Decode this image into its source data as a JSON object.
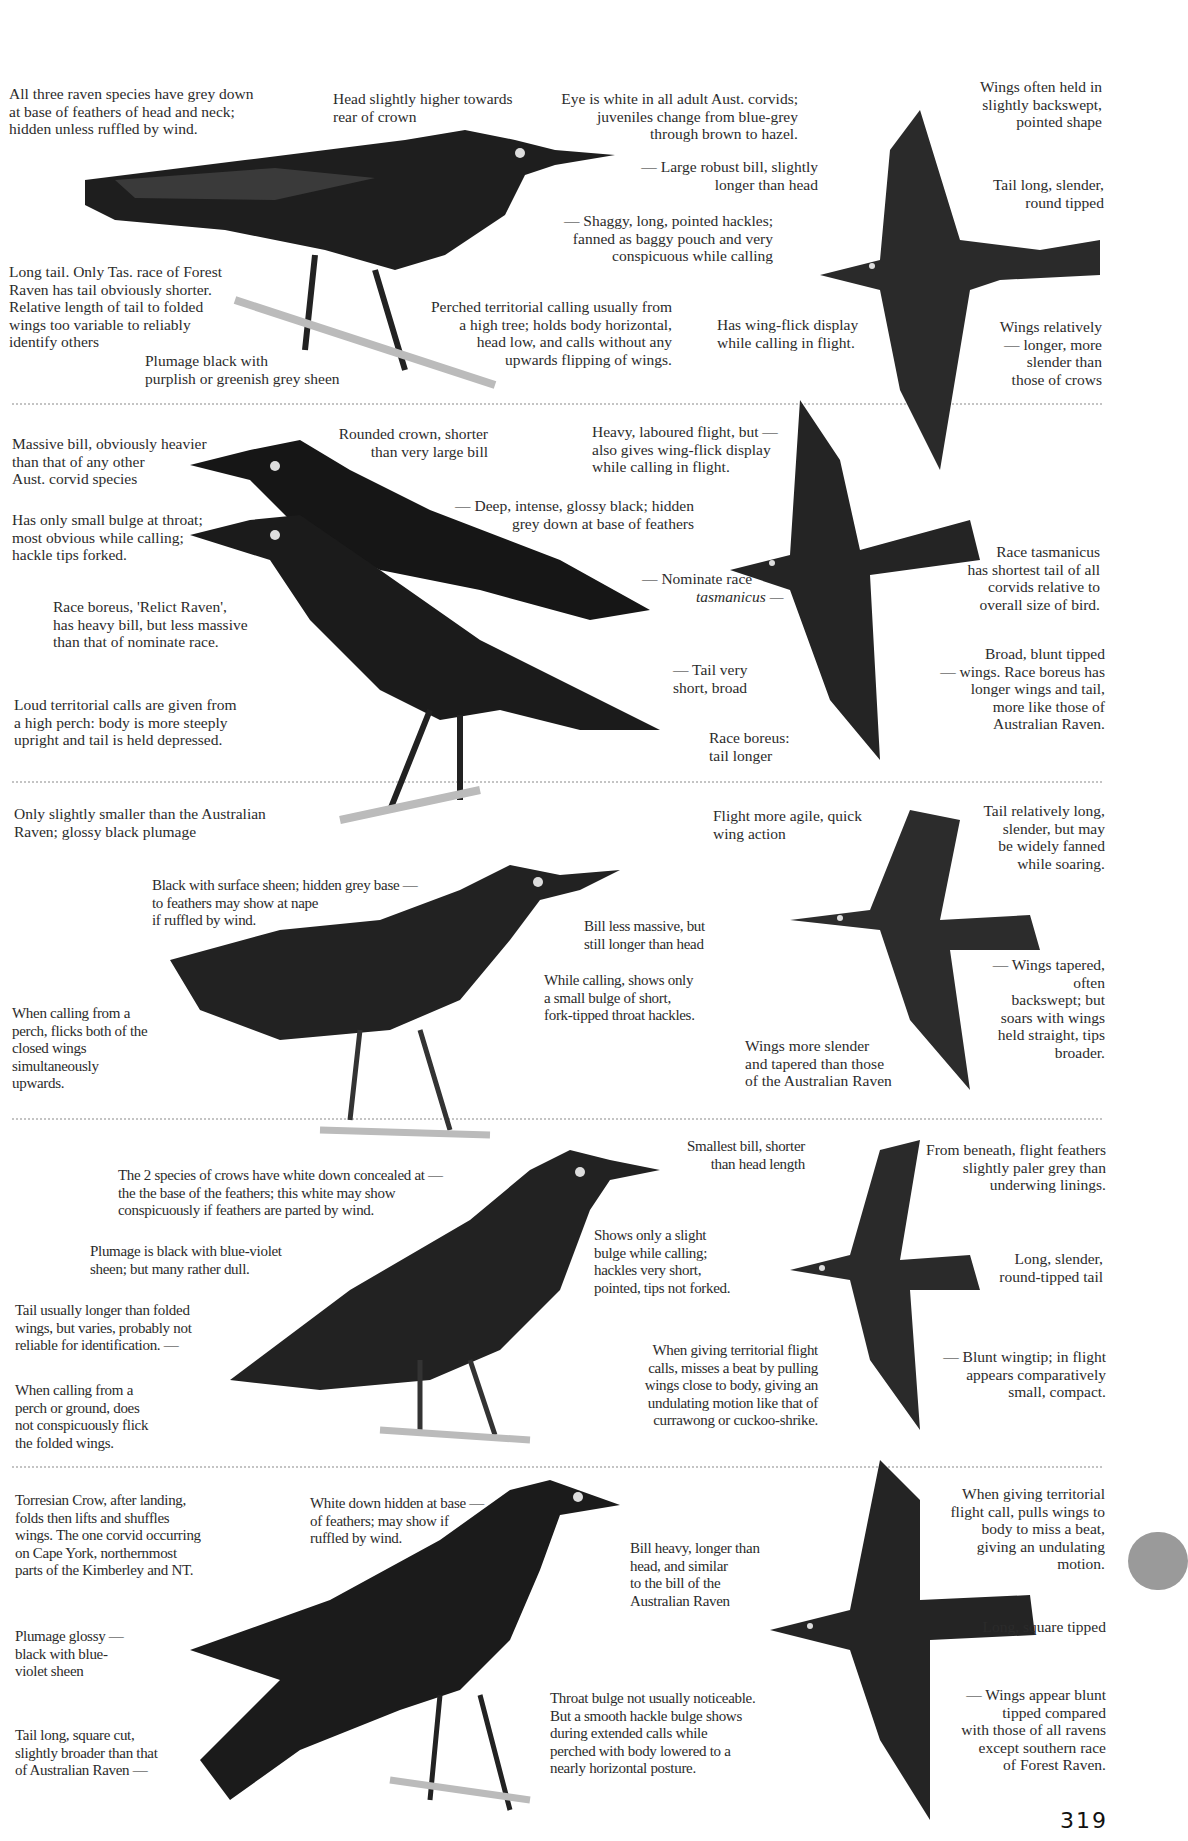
{
  "page": {
    "number": "319",
    "thumb_tab_color": "#9a9a9a",
    "ink_color": "#2b2b2b",
    "bird_color": "#1e1e1e"
  },
  "sections": [
    {
      "id": "raven-1",
      "perched_notes": [
        "All three raven species have grey down\nat base of feathers of head and neck;\nhidden unless ruffled by wind.",
        "Head slightly higher towards\nrear of crown",
        "Eye is white in all adult Aust. corvids;\njuveniles change from blue-grey\nthrough brown to hazel.",
        "— Large robust bill, slightly\nlonger than head",
        "— Shaggy, long, pointed hackles;\nfanned as baggy pouch and very\nconspicuous while calling",
        "Long tail.  Only Tas. race of Forest\nRaven has tail obviously shorter.\nRelative length of tail to folded\nwings too variable to reliably\nidentify others",
        "Plumage black with\npurplish or greenish grey sheen",
        "Perched territorial calling usually from\na high tree; holds body horizontal,\nhead low, and calls without any\nupwards flipping of wings."
      ],
      "flight_notes": [
        "Wings often held in\nslightly backswept,\npointed shape",
        "Tail long, slender,\nround tipped",
        "Has wing-flick display\nwhile calling in flight.",
        "Wings relatively\n—  longer, more\nslender than\nthose of crows"
      ]
    },
    {
      "id": "raven-2",
      "perched_notes": [
        "Massive bill, obviously heavier\nthan that of any other\nAust. corvid species",
        "Rounded crown, shorter\nthan very large bill",
        "— Deep, intense, glossy black; hidden\ngrey down at base of feathers",
        "Has only small bulge at throat;\nmost obvious while calling;\nhackle tips forked.",
        "Race boreus, 'Relict Raven',\nhas heavy bill, but less massive\nthan that of nominate race.",
        "Loud territorial calls are given from\na high perch: body is more steeply\nupright and tail is held depressed.",
        "— Nominate race",
        "tasmanicus —",
        "— Tail very\nshort, broad",
        "Race boreus:\ntail longer"
      ],
      "flight_notes": [
        "Heavy, laboured flight, but —\nalso gives wing-flick display\nwhile calling in flight.",
        "Race tasmanicus\nhas shortest tail of all\ncorvids relative to\noverall size of bird.",
        "Broad, blunt tipped\n—  wings. Race boreus has\nlonger wings and tail,\nmore like those of\nAustralian Raven."
      ]
    },
    {
      "id": "raven-3",
      "perched_notes": [
        "Only slightly smaller than the Australian\nRaven; glossy black plumage",
        "Black with surface sheen; hidden grey base —\nto feathers may show at nape\nif ruffled by wind.",
        "Bill less massive, but\nstill longer than head",
        "While calling, shows only\na small bulge of short,\nfork-tipped throat hackles.",
        "When calling from a\nperch, flicks both of the\nclosed wings\nsimultaneously\nupwards."
      ],
      "flight_notes": [
        "Flight more agile, quick\nwing action",
        "Tail relatively long,\nslender, but may\nbe widely fanned\nwhile soaring.",
        "— Wings tapered, often\nbackswept; but\nsoars with wings\nheld straight, tips\nbroader.",
        "Wings more slender\nand tapered than those\nof the Australian Raven"
      ]
    },
    {
      "id": "crow-1",
      "perched_notes": [
        "The 2 species of crows have white down concealed at —\nthe the base of the feathers; this white may show\nconspicuously if feathers are parted by wind.",
        "Smallest bill, shorter\nthan head length",
        "Plumage is black with blue-violet\nsheen; but many rather dull.",
        "Shows only a slight\nbulge while calling;\nhackles very short,\npointed, tips not forked.",
        "Tail usually longer than folded\nwings, but varies, probably not\nreliable for identification. —",
        "When calling from a\nperch or ground, does\nnot conspicuously flick\nthe folded wings.",
        "When giving territorial flight\ncalls, misses a beat by pulling\nwings close to body, giving an\nundulating motion like that of\ncurrawong or cuckoo-shrike."
      ],
      "flight_notes": [
        "From beneath, flight feathers\nslightly paler grey than\nunderwing linings.",
        "Long, slender,\nround-tipped tail",
        "— Blunt wingtip; in flight\nappears comparatively\nsmall, compact."
      ]
    },
    {
      "id": "crow-2",
      "perched_notes": [
        "Torresian Crow, after landing,\nfolds then lifts and shuffles\nwings. The one corvid occurring\non Cape York, northernmost\nparts of the Kimberley and NT.",
        "White down hidden at base —\nof feathers; may show if\nruffled by wind.",
        "Bill heavy, longer than\nhead, and similar\nto the bill of the\nAustralian Raven",
        "Plumage glossy  —\nblack with blue-\nviolet sheen",
        "Tail long, square cut,\nslightly broader than that\nof Australian Raven  —",
        "Throat bulge not usually noticeable.\nBut a smooth hackle bulge shows\nduring extended calls while\nperched with body lowered to a\nnearly horizontal posture."
      ],
      "flight_notes": [
        "When giving territorial\nflight call, pulls wings to\nbody to miss a beat,\ngiving an undulating\nmotion.",
        "Long, square tipped",
        "—  Wings appear blunt\ntipped compared\nwith those of all ravens\nexcept southern race\nof Forest Raven."
      ]
    }
  ]
}
